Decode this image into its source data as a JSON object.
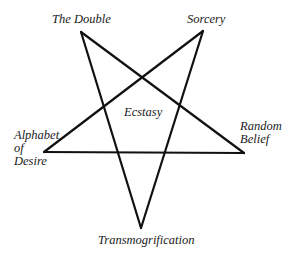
{
  "diagram": {
    "type": "pentagram",
    "stroke_color": "#111111",
    "background_color": "#ffffff",
    "center_label": "Ecstasy",
    "vertices": {
      "top_left": {
        "label": "The Double",
        "x": 81,
        "y": 32
      },
      "top_right": {
        "label": "Sorcery",
        "x": 203,
        "y": 31
      },
      "left": {
        "label_lines": [
          "Alphabet",
          "of",
          "Desire"
        ],
        "x": 44,
        "y": 152
      },
      "right": {
        "label_lines": [
          "Random",
          "Belief"
        ],
        "x": 244,
        "y": 153
      },
      "bottom": {
        "label": "Transmogrification",
        "x": 141,
        "y": 228
      }
    }
  }
}
